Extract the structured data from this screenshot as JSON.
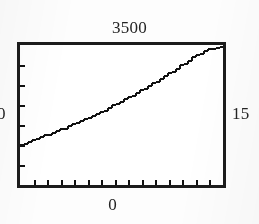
{
  "figure": {
    "background_color": "#fdfdfd",
    "frame_color": "#1c1c1c",
    "curve_color": "#111111"
  },
  "labels": {
    "top": "3500",
    "bottom": "0",
    "left": "0",
    "right": "15"
  },
  "chart_data": {
    "type": "line",
    "title": "",
    "xlabel": "",
    "ylabel": "",
    "xlim": [
      0,
      15
    ],
    "ylim": [
      0,
      3500
    ],
    "grid": false,
    "legend": null,
    "axis_corner_labels": {
      "top": "3500",
      "bottom": "0",
      "left": "0",
      "right": "15"
    },
    "x_ticks": [
      1,
      2,
      3,
      4,
      5,
      6,
      7,
      8,
      9,
      10,
      11,
      12,
      13,
      14,
      15
    ],
    "y_ticks": [
      500,
      1000,
      1500,
      2000,
      2500,
      3000
    ],
    "tick_direction": "in",
    "series": [
      {
        "name": "curve",
        "x": [
          0,
          1,
          2,
          3,
          4,
          5,
          6,
          7,
          8,
          9,
          10,
          11,
          12,
          13,
          14,
          15
        ],
        "y": [
          1010,
          1130,
          1255,
          1390,
          1530,
          1680,
          1840,
          2010,
          2190,
          2380,
          2580,
          2790,
          3010,
          3240,
          3400,
          3470
        ]
      }
    ]
  }
}
